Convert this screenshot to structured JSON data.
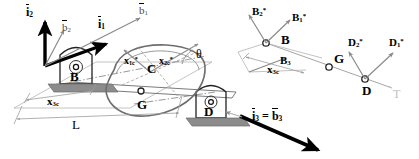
{
  "figure": {
    "type": "mechanical-schematic",
    "background_color": "#ffffff",
    "stroke_color": "#000000",
    "support_color": "#808080",
    "axis_line_color": "#9a9a9a",
    "body_outline_color": "#6e6e6e",
    "width": 419,
    "height": 159
  },
  "left_panel": {
    "name": "physical-configuration-view",
    "frame_vectors": [
      {
        "id": "i2",
        "base": "i",
        "sub": "2",
        "overbar": true,
        "label": "i2",
        "style": "thick-black",
        "direction": "up"
      },
      {
        "id": "i1",
        "base": "i",
        "sub": "1",
        "overbar": true,
        "label": "i1",
        "style": "thick-black",
        "direction": "up-right"
      },
      {
        "id": "b2",
        "base": "b",
        "sub": "2",
        "overbar": true,
        "label": "b2",
        "style": "thin-gray",
        "direction": "up-slight-right"
      },
      {
        "id": "b1",
        "base": "b",
        "sub": "1",
        "overbar": true,
        "label": "b1",
        "style": "thin-gray",
        "direction": "up-right"
      }
    ],
    "points": [
      {
        "id": "B",
        "label": "B",
        "role": "left-bearing"
      },
      {
        "id": "C",
        "label": "C",
        "role": "disk-center"
      },
      {
        "id": "G",
        "label": "G",
        "role": "center-of-mass"
      },
      {
        "id": "D",
        "label": "D",
        "role": "right-bearing"
      }
    ],
    "dimension_labels": [
      {
        "id": "x3c",
        "base": "x",
        "sub": "3c",
        "label": "x3c",
        "description": "axial distance from B to G"
      },
      {
        "id": "L",
        "base": "L",
        "sub": "",
        "label": "L",
        "description": "total shaft length between bearings"
      }
    ],
    "offset_labels": [
      {
        "id": "x1c_star",
        "base": "x",
        "sub": "1c",
        "star": true,
        "label": "x1c*"
      },
      {
        "id": "x2c_star",
        "base": "x",
        "sub": "2c",
        "star": true,
        "label": "x2c*"
      }
    ],
    "angle_label": {
      "id": "theta",
      "label": "θ",
      "description": "disk rotation angle"
    }
  },
  "right_panel": {
    "name": "reaction-force-view",
    "points": [
      {
        "id": "B",
        "label": "B",
        "role": "left-bearing-node"
      },
      {
        "id": "G",
        "label": "G",
        "role": "center-of-mass-node"
      },
      {
        "id": "D",
        "label": "D",
        "role": "right-bearing-node"
      }
    ],
    "reaction_vectors": [
      {
        "id": "B2_star",
        "base": "B",
        "sub": "2",
        "star": true,
        "label": "B2*",
        "at": "B",
        "direction": "up-left"
      },
      {
        "id": "B1_star",
        "base": "B",
        "sub": "1",
        "star": true,
        "label": "B1*",
        "at": "B",
        "direction": "up-right"
      },
      {
        "id": "B3",
        "base": "B",
        "sub": "3",
        "star": false,
        "label": "B3",
        "at": "B",
        "direction": "right-up"
      },
      {
        "id": "D2_star",
        "base": "D",
        "sub": "2",
        "star": true,
        "label": "D2*",
        "at": "D",
        "direction": "up-left"
      },
      {
        "id": "D1_star",
        "base": "D",
        "sub": "1",
        "star": true,
        "label": "D1*",
        "at": "D",
        "direction": "up-right"
      }
    ],
    "dimension_labels": [
      {
        "id": "x3c",
        "base": "x",
        "sub": "3c",
        "label": "x3c",
        "description": "axial distance from B to G"
      }
    ],
    "axis_end_label": {
      "id": "T",
      "label": "T",
      "description": "torque / shaft axis end marker"
    }
  },
  "bottom_label": {
    "id": "i3_equals_b3",
    "left": {
      "base": "i",
      "sub": "3",
      "overbar": true
    },
    "equals": "=",
    "right": {
      "base": "b",
      "sub": "3",
      "overbar": true
    },
    "description": "thick black arrow marking shaft axial direction"
  }
}
